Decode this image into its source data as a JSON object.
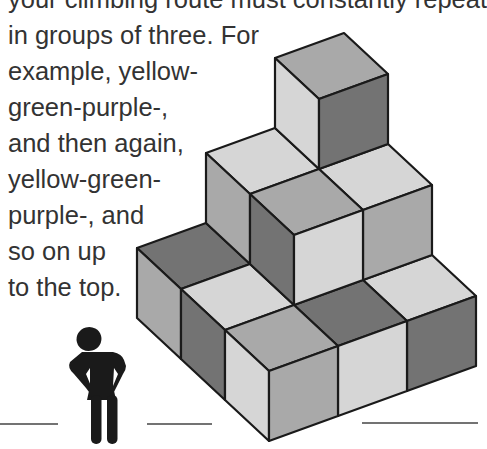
{
  "text": {
    "lines": [
      "your climbing route must constantly repeat",
      "in groups of three. For",
      "example, yellow-",
      "green-purple-,",
      "and then again,",
      "yellow-green-",
      "purple-, and",
      "so on up",
      "to the top."
    ]
  },
  "colors": {
    "light": "#d6d6d6",
    "medium": "#a9a9a9",
    "dark": "#737373",
    "ink": "#1a1a1a",
    "text": "#333333"
  },
  "figure": {
    "icon": "person-icon"
  },
  "staircase": {
    "levels": 3,
    "faces": [
      {
        "name": "l0-c20-top",
        "shade": "dark",
        "points": "206,223 137,248 181,289 250,264"
      },
      {
        "name": "l0-c20-left",
        "shade": "medium",
        "points": "137,248 181,289 181,359 137,318"
      },
      {
        "name": "l0-c21-top",
        "shade": "light",
        "points": "250,264 181,289 225,330 294,305"
      },
      {
        "name": "l0-c21-left",
        "shade": "dark",
        "points": "181,289 225,330 225,400 181,359"
      },
      {
        "name": "l0-c02-top",
        "shade": "light",
        "points": "432,255 363,280 407,321 476,296"
      },
      {
        "name": "l0-c02-right",
        "shade": "dark",
        "points": "476,296 407,321 407,391 476,366"
      },
      {
        "name": "l0-c12-top",
        "shade": "dark",
        "points": "363,280 294,305 338,346 407,321"
      },
      {
        "name": "l0-c12-right",
        "shade": "light",
        "points": "407,321 338,346 338,416 407,391"
      },
      {
        "name": "l0-c22-top",
        "shade": "medium",
        "points": "294,305 225,330 269,371 338,346"
      },
      {
        "name": "l0-c22-left",
        "shade": "light",
        "points": "225,330 269,371 269,441 225,400"
      },
      {
        "name": "l0-c22-right",
        "shade": "medium",
        "points": "338,346 269,371 269,441 338,416"
      },
      {
        "name": "l1-c10-top",
        "shade": "light",
        "points": "275,128 206,153 250,194 319,169"
      },
      {
        "name": "l1-c10-left",
        "shade": "medium",
        "points": "206,153 250,194 250,264 206,223"
      },
      {
        "name": "l1-c01-top",
        "shade": "light",
        "points": "388,144 319,169 363,210 432,185"
      },
      {
        "name": "l1-c01-right",
        "shade": "medium",
        "points": "432,185 363,210 363,280 432,255"
      },
      {
        "name": "l1-c11-top",
        "shade": "medium",
        "points": "319,169 250,194 294,235 363,210"
      },
      {
        "name": "l1-c11-left",
        "shade": "dark",
        "points": "250,194 294,235 294,305 250,264"
      },
      {
        "name": "l1-c11-right",
        "shade": "light",
        "points": "363,210 294,235 294,305 363,280"
      },
      {
        "name": "l2-c00-top",
        "shade": "medium",
        "points": "344,33 275,58 319,99 388,74"
      },
      {
        "name": "l2-c00-left",
        "shade": "light",
        "points": "275,58 319,99 319,169 275,128"
      },
      {
        "name": "l2-c00-right",
        "shade": "dark",
        "points": "388,74 319,99 319,169 388,144"
      }
    ]
  },
  "ground_lines": [
    {
      "x1": 0,
      "x2": 58,
      "y": 424
    },
    {
      "x1": 147,
      "x2": 212,
      "y": 424
    },
    {
      "x1": 362,
      "x2": 478,
      "y": 423
    }
  ]
}
